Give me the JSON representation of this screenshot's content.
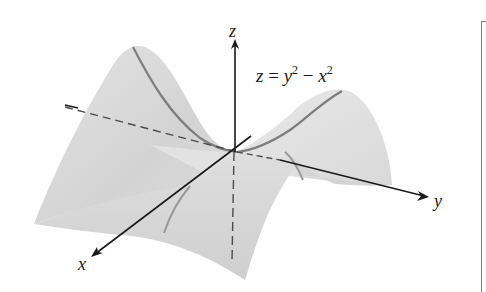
{
  "figure": {
    "equation": {
      "lhs": "z",
      "equals": "=",
      "term1_var": "y",
      "term1_exp": "2",
      "minus": "−",
      "term2_var": "x",
      "term2_exp": "2"
    },
    "axes": {
      "z_label": "z",
      "y_label": "y",
      "x_label": "x"
    },
    "colors": {
      "surface_light": "#e9e9e9",
      "surface_mid": "#d6d6d6",
      "surface_dark": "#c4c4c4",
      "trace_curve": "#7d7d7d",
      "axis": "#1a1a1a",
      "dashed_axis": "#4a4a4a",
      "frame": "#7a7a7a",
      "background": "#ffffff"
    }
  }
}
